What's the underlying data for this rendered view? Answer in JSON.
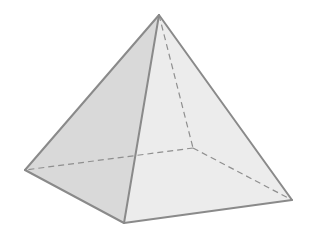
{
  "diagram": {
    "shape": "square pyramid",
    "vertices": {
      "apex": [
        159,
        15
      ],
      "left": [
        25,
        170
      ],
      "front": [
        124,
        223
      ],
      "right": [
        292,
        200
      ],
      "back": [
        193,
        148
      ]
    },
    "faces": [
      {
        "name": "left-face",
        "points": [
          "apex",
          "left",
          "front"
        ],
        "fill": "#d9d9d9"
      },
      {
        "name": "right-face",
        "points": [
          "apex",
          "front",
          "right"
        ],
        "fill": "#ececec"
      }
    ],
    "visible_edges": [
      [
        "apex",
        "left"
      ],
      [
        "apex",
        "front"
      ],
      [
        "apex",
        "right"
      ],
      [
        "left",
        "front"
      ],
      [
        "front",
        "right"
      ]
    ],
    "hidden_edges": [
      [
        "apex",
        "back"
      ],
      [
        "back",
        "left"
      ],
      [
        "back",
        "right"
      ]
    ],
    "colors": {
      "edge": "#8a8a8a",
      "hidden_edge": "#8f8f8f",
      "background": "#ffffff"
    }
  }
}
